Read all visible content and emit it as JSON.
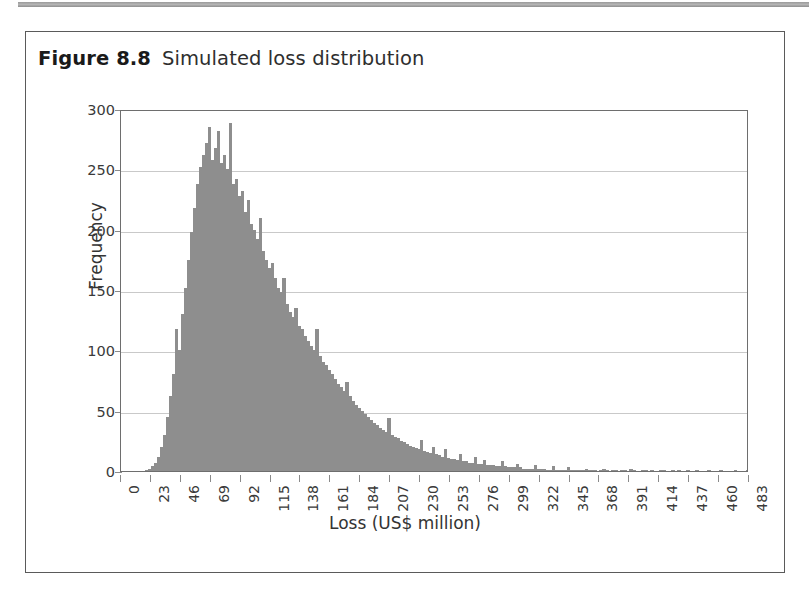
{
  "figure": {
    "number": "Figure 8.8",
    "caption": "Simulated loss distribution"
  },
  "chart_data": {
    "type": "bar",
    "title": "Simulated loss distribution",
    "xlabel": "Loss (US$ million)",
    "ylabel": "Frequency",
    "xlim": [
      0,
      483
    ],
    "ylim": [
      0,
      300
    ],
    "grid": true,
    "legend": null,
    "bar_color": "#8e8e8e",
    "bin_width": 2.3,
    "xticks": [
      0,
      23,
      46,
      69,
      92,
      115,
      138,
      161,
      184,
      207,
      230,
      253,
      276,
      299,
      322,
      345,
      368,
      391,
      414,
      437,
      460,
      483
    ],
    "yticks": [
      0,
      50,
      100,
      150,
      200,
      250,
      300
    ],
    "x": [
      1.15,
      3.45,
      5.75,
      8.05,
      10.35,
      12.65,
      14.95,
      17.25,
      19.55,
      21.85,
      24.15,
      26.45,
      28.75,
      31.05,
      33.35,
      35.65,
      37.95,
      40.25,
      42.55,
      44.85,
      47.15,
      49.45,
      51.75,
      54.05,
      56.35,
      58.65,
      60.95,
      63.25,
      65.55,
      67.85,
      70.15,
      72.45,
      74.75,
      77.05,
      79.35,
      81.65,
      83.95,
      86.25,
      88.55,
      90.85,
      93.15,
      95.45,
      97.75,
      100.05,
      102.35,
      104.65,
      106.95,
      109.25,
      111.55,
      113.85,
      116.15,
      118.45,
      120.75,
      123.05,
      125.35,
      127.65,
      129.95,
      132.25,
      134.55,
      136.85,
      139.15,
      141.45,
      143.75,
      146.05,
      148.35,
      150.65,
      152.95,
      155.25,
      157.55,
      159.85,
      162.15,
      164.45,
      166.75,
      169.05,
      171.35,
      173.65,
      175.95,
      178.25,
      180.55,
      182.85,
      185.15,
      187.45,
      189.75,
      192.05,
      194.35,
      196.65,
      198.95,
      201.25,
      203.55,
      205.85,
      208.15,
      210.45,
      212.75,
      215.05,
      217.35,
      219.65,
      221.95,
      224.25,
      226.55,
      228.85,
      231.15,
      233.45,
      235.75,
      238.05,
      240.35,
      242.65,
      244.95,
      247.25,
      249.55,
      251.85,
      254.15,
      256.45,
      258.75,
      261.05,
      263.35,
      265.65,
      267.95,
      270.25,
      272.55,
      274.85,
      277.15,
      279.45,
      281.75,
      284.05,
      286.35,
      288.65,
      290.95,
      293.25,
      295.55,
      297.85,
      300.15,
      302.45,
      304.75,
      307.05,
      309.35,
      311.65,
      313.95,
      316.25,
      318.55,
      320.85,
      323.15,
      325.45,
      327.75,
      330.05,
      332.35,
      334.65,
      336.95,
      339.25,
      341.55,
      343.85,
      346.15,
      348.45,
      350.75,
      353.05,
      355.35,
      357.65,
      359.95,
      362.25,
      364.55,
      366.85,
      369.15,
      371.45,
      373.75,
      376.05,
      378.35,
      380.65,
      382.95,
      385.25,
      387.55,
      389.85,
      392.15,
      394.45,
      396.75,
      399.05,
      401.35,
      403.65,
      405.95,
      408.25,
      410.55,
      412.85,
      415.15,
      417.45,
      419.75,
      422.05,
      424.35,
      426.65,
      428.95,
      431.25,
      433.55,
      435.85,
      438.15,
      440.45,
      442.75,
      445.05,
      447.35,
      449.65,
      451.95,
      454.25,
      456.55,
      458.85,
      461.15,
      463.45,
      465.75,
      468.05,
      470.35,
      472.65,
      474.95,
      477.25,
      479.55,
      481.85
    ],
    "values": [
      0,
      0,
      0,
      0,
      0,
      0,
      0,
      0,
      1,
      2,
      4,
      7,
      12,
      20,
      30,
      45,
      62,
      80,
      118,
      100,
      130,
      152,
      175,
      198,
      218,
      238,
      252,
      262,
      272,
      285,
      258,
      268,
      282,
      255,
      262,
      250,
      288,
      238,
      242,
      228,
      232,
      215,
      225,
      205,
      200,
      192,
      210,
      182,
      175,
      168,
      172,
      160,
      152,
      148,
      160,
      138,
      132,
      128,
      135,
      120,
      118,
      112,
      108,
      104,
      100,
      118,
      95,
      90,
      88,
      84,
      80,
      76,
      72,
      70,
      66,
      74,
      62,
      58,
      55,
      52,
      50,
      47,
      45,
      42,
      40,
      38,
      36,
      34,
      32,
      44,
      30,
      28,
      27,
      25,
      24,
      22,
      21,
      20,
      19,
      18,
      26,
      17,
      16,
      15,
      20,
      14,
      13,
      12,
      18,
      11,
      10,
      10,
      9,
      14,
      8,
      8,
      7,
      7,
      12,
      6,
      6,
      9,
      5,
      5,
      5,
      4,
      4,
      8,
      4,
      3,
      3,
      3,
      6,
      3,
      2,
      2,
      2,
      2,
      5,
      2,
      2,
      2,
      1,
      1,
      4,
      1,
      1,
      1,
      1,
      3,
      1,
      1,
      1,
      1,
      1,
      2,
      1,
      1,
      1,
      0,
      1,
      2,
      1,
      0,
      1,
      1,
      0,
      1,
      1,
      0,
      2,
      1,
      0,
      0,
      1,
      1,
      0,
      1,
      0,
      0,
      1,
      1,
      0,
      0,
      1,
      0,
      1,
      0,
      0,
      1,
      0,
      0,
      1,
      0,
      0,
      0,
      1,
      0,
      0,
      0,
      1,
      0,
      0,
      0,
      0,
      1,
      0,
      0,
      0,
      1
    ]
  }
}
